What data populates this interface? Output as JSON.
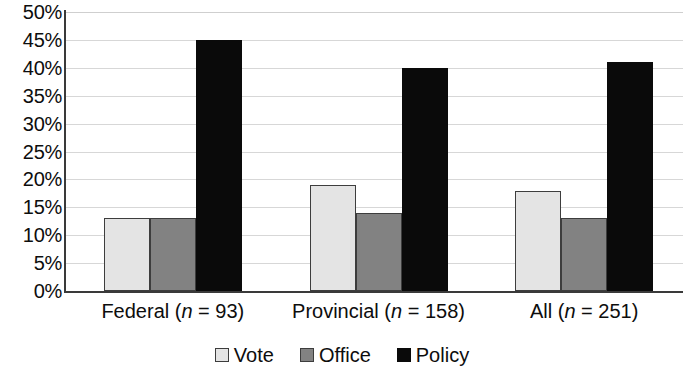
{
  "chart_data": {
    "type": "bar",
    "title": "",
    "subtitle": "",
    "xlabel": "",
    "ylabel": "",
    "grid": true,
    "legend_position": "bottom",
    "ylim": [
      0,
      50
    ],
    "y_tick_labels": [
      "50%",
      "45%",
      "40%",
      "35%",
      "30%",
      "25%",
      "20%",
      "15%",
      "10%",
      "5%",
      "0%"
    ],
    "y_tick_values": [
      50,
      45,
      40,
      35,
      30,
      25,
      20,
      15,
      10,
      5,
      0
    ],
    "categories": [
      {
        "name": "Federal",
        "n": 93,
        "label_prefix": "Federal (",
        "label_n": "n",
        "label_suffix": " = 93)"
      },
      {
        "name": "Provincial",
        "n": 158,
        "label_prefix": "Provincial (",
        "label_n": "n",
        "label_suffix": " = 158)"
      },
      {
        "name": "All",
        "n": 251,
        "label_prefix": "All (",
        "label_n": "n",
        "label_suffix": " = 251)"
      }
    ],
    "series": [
      {
        "name": "Vote",
        "color": "#e4e4e4",
        "values": [
          13,
          19,
          18
        ]
      },
      {
        "name": "Office",
        "color": "#828282",
        "values": [
          13,
          14,
          13
        ]
      },
      {
        "name": "Policy",
        "color": "#0a0a0a",
        "values": [
          45,
          40,
          41
        ]
      }
    ]
  },
  "legend": {
    "items": [
      {
        "label": "Vote",
        "series": "vote"
      },
      {
        "label": "Office",
        "series": "office"
      },
      {
        "label": "Policy",
        "series": "policy"
      }
    ]
  }
}
